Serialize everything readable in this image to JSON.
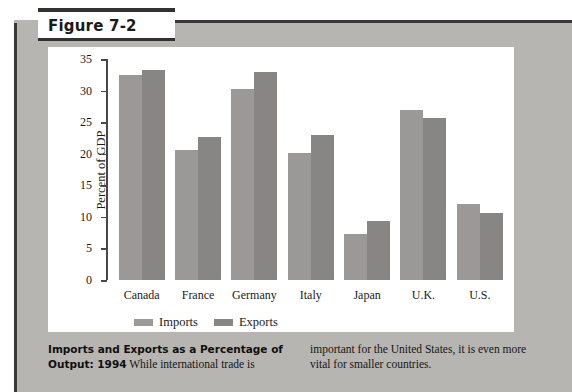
{
  "figure": {
    "tab_label": "Figure 7-2"
  },
  "chart_data": {
    "type": "bar",
    "title": "",
    "xlabel": "",
    "ylabel": "Percent of GDP",
    "ylim": [
      0,
      35
    ],
    "yticks": [
      0,
      5,
      10,
      15,
      20,
      25,
      30,
      35
    ],
    "grid": false,
    "legend_position": "bottom-left",
    "categories": [
      "Canada",
      "France",
      "Germany",
      "Italy",
      "Japan",
      "U.K.",
      "U.S."
    ],
    "series": [
      {
        "name": "Imports",
        "color": "#9a9998",
        "values": [
          32.5,
          20.6,
          30.3,
          20.1,
          7.3,
          26.9,
          12.0
        ]
      },
      {
        "name": "Exports",
        "color": "#878685",
        "values": [
          33.2,
          22.7,
          33.0,
          22.9,
          9.4,
          25.7,
          10.6
        ]
      }
    ]
  },
  "legend": {
    "items": [
      {
        "label": "Imports"
      },
      {
        "label": "Exports"
      }
    ]
  },
  "caption": {
    "left_bold": "Imports and Exports as a Percentage of Output: 1994",
    "left_body": "While international trade is",
    "right_body": "important for the United States, it is even more vital for smaller countries."
  },
  "colors": {
    "panel": "#b6b5b2",
    "frame_dark": "#3a3836",
    "card": "#ffffff",
    "axis": "#4a4846"
  }
}
